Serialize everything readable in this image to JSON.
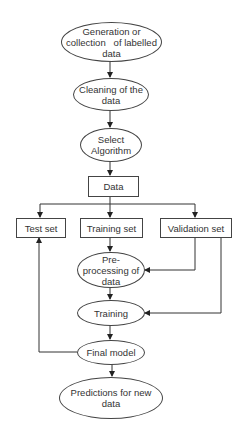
{
  "diagram": {
    "type": "flowchart",
    "nodes": [
      {
        "id": "generation",
        "shape": "ellipse",
        "label": "Generation or collection of labelled data"
      },
      {
        "id": "cleaning",
        "shape": "ellipse",
        "label": "Cleaning of the data"
      },
      {
        "id": "select_algorithm",
        "shape": "ellipse",
        "label": "Select Algorithm"
      },
      {
        "id": "data",
        "shape": "rectangle",
        "label": "Data"
      },
      {
        "id": "test_set",
        "shape": "rectangle",
        "label": "Test set"
      },
      {
        "id": "training_set",
        "shape": "rectangle",
        "label": "Training set"
      },
      {
        "id": "validation_set",
        "shape": "rectangle",
        "label": "Validation set"
      },
      {
        "id": "preprocessing",
        "shape": "ellipse",
        "label": "Pre-processing of data"
      },
      {
        "id": "training",
        "shape": "ellipse",
        "label": "Training"
      },
      {
        "id": "final_model",
        "shape": "ellipse",
        "label": "Final model"
      },
      {
        "id": "predictions",
        "shape": "ellipse",
        "label": "Predictions for new data"
      }
    ],
    "edges": [
      {
        "from": "generation",
        "to": "cleaning"
      },
      {
        "from": "cleaning",
        "to": "select_algorithm"
      },
      {
        "from": "select_algorithm",
        "to": "data"
      },
      {
        "from": "data",
        "to": "test_set"
      },
      {
        "from": "data",
        "to": "training_set"
      },
      {
        "from": "data",
        "to": "validation_set"
      },
      {
        "from": "training_set",
        "to": "preprocessing"
      },
      {
        "from": "validation_set",
        "to": "preprocessing"
      },
      {
        "from": "validation_set",
        "to": "training"
      },
      {
        "from": "preprocessing",
        "to": "training"
      },
      {
        "from": "training",
        "to": "final_model"
      },
      {
        "from": "final_model",
        "to": "test_set"
      },
      {
        "from": "final_model",
        "to": "predictions"
      }
    ]
  },
  "labels": {
    "generation_l1": "Generation or",
    "generation_l2": "collection   of labelled",
    "generation_l3": "data",
    "cleaning_l1": "Cleaning of the",
    "cleaning_l2": "data",
    "select_l1": "Select",
    "select_l2": "Algorithm",
    "data": "Data",
    "test_set": "Test set",
    "training_set": "Training set",
    "validation_set": "Validation set",
    "preprocessing_l1": "Pre-",
    "preprocessing_l2": "processing of",
    "preprocessing_l3": "data",
    "training": "Training",
    "final_model": "Final model",
    "predictions_l1": "Predictions for new",
    "predictions_l2": "data"
  }
}
